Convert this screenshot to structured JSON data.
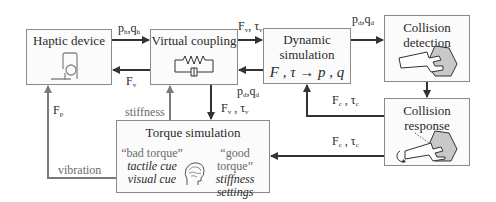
{
  "diagram": {
    "boxes": {
      "haptic_device": {
        "title": "Haptic device",
        "icon": "haptic-device-icon"
      },
      "virtual_coupling": {
        "title": "Virtual coupling",
        "icon": "spring-damper-icon"
      },
      "dynamic_simulation": {
        "title_line1": "Dynamic",
        "title_line2": "simulation",
        "formula": "F , τ → p , q"
      },
      "collision_detection": {
        "title_line1": "Collision",
        "title_line2": "detection",
        "icon": "wrench-nut-icon"
      },
      "collision_response": {
        "title_line1": "Collision",
        "title_line2": "response",
        "icon": "wrench-rotate-icon"
      },
      "torque_simulation": {
        "title": "Torque simulation",
        "left": {
          "quote": "“bad torque”",
          "line1": "tactile cue",
          "line2": "visual cue"
        },
        "right": {
          "quote": "“good torque”",
          "line1": "stiffness",
          "line2": "settings"
        },
        "icon": "head-brain-icon"
      }
    },
    "edges": {
      "haptic_to_coupling": {
        "main": "p",
        "sub1": "h",
        "sep": ",",
        "main2": "q",
        "sub2": "h"
      },
      "coupling_to_haptic": {
        "main": "F",
        "sub": "v"
      },
      "coupling_to_dynamic": {
        "main": "F",
        "sub1": "v",
        "sep": ", ",
        "main2": "τ",
        "sub2": "v"
      },
      "dynamic_to_coupling": {
        "main": "p",
        "sub1": "d",
        "sep": ",",
        "main2": "q",
        "sub2": "d"
      },
      "dynamic_to_detection": {
        "main": "p",
        "sub1": "d",
        "sep": ",",
        "main2": "q",
        "sub2": "d"
      },
      "response_to_dynamic": {
        "main": "F",
        "sub1": "c",
        "sep": " , ",
        "main2": "τ",
        "sub2": "c"
      },
      "response_to_torque": {
        "main": "F",
        "sub1": "c",
        "sep": " , ",
        "main2": "τ",
        "sub2": "c"
      },
      "coupling_to_torque": {
        "main": "F",
        "sub1": "v",
        "sep": " , ",
        "main2": "τ",
        "sub2": "v"
      },
      "torque_to_coupling": {
        "label": "stiffness"
      },
      "torque_to_haptic_vibration": {
        "label": "vibration"
      },
      "torque_to_haptic_force": {
        "main": "F",
        "sub": "p"
      }
    },
    "colors": {
      "line_dark": "#333333",
      "line_gray": "#7a7a7a",
      "box_border": "#8a8a8a",
      "hand_fill": "#c8c8c8"
    }
  }
}
